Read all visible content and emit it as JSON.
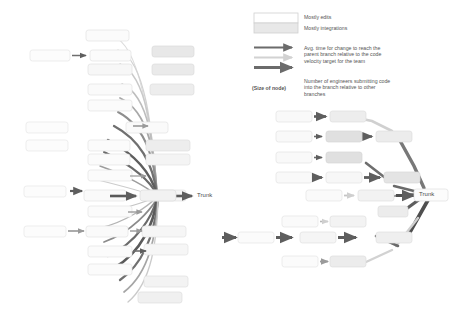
{
  "canvas": {
    "width": 456,
    "height": 311,
    "background": "#ffffff"
  },
  "legend": {
    "swatches": [
      {
        "name": "mostly-edits",
        "label": "Mostly edits",
        "fill": "#ffffff",
        "stroke": "#d0d0d0"
      },
      {
        "name": "mostly-integrations",
        "label": "Mostly integrations",
        "fill": "#e8e8e8",
        "stroke": "#cfcfcf"
      }
    ],
    "arrows": {
      "label": "Avg. time for change to reach the\nparent branch relative to the code\nvelocity target for the team",
      "samples": [
        {
          "name": "arrow-dark-thin",
          "color": "#6b6b6b",
          "width": 2.2
        },
        {
          "name": "arrow-light",
          "color": "#d2d2d2",
          "width": 2.2
        },
        {
          "name": "arrow-dark-thick",
          "color": "#6b6b6b",
          "width": 3.0
        }
      ]
    },
    "node_size": {
      "key": "(Size of node)",
      "label": "Number of engineers submitting code\ninto the branch relative to other\nbranches"
    }
  },
  "diagrams": [
    {
      "name": "left-fan-diagram",
      "trunk_label": "Trunk",
      "description": "Many branches fanning into a single trunk node",
      "node_count": 26
    },
    {
      "name": "right-tree-diagram",
      "trunk_label": "Trunk",
      "description": "Hierarchical branch tree converging into trunk",
      "node_count": 22
    }
  ],
  "colors": {
    "node_edits_fill": "#fbfbfb",
    "node_edits_stroke": "#e3e3e3",
    "node_integrations_fill": "#e6e6e6",
    "node_integrations_stroke": "#d8d8d8",
    "edge_dark": "#5e5e5e",
    "edge_mid": "#9a9a9a",
    "edge_light": "#d5d5d5",
    "text": "#4a4a4a"
  }
}
